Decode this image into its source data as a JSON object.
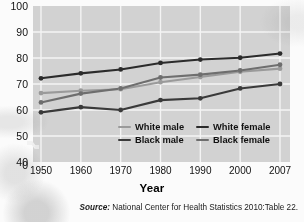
{
  "axis_title": "Year",
  "source": {
    "label": "Source:",
    "text": "National Center for Health Statistics 2010:Table 22."
  },
  "colors": {
    "plot_background": "#d2d2d2",
    "gridline": "#f4f4f4",
    "white_male": "#9a9a9a",
    "black_male": "#3a3a3a",
    "white_female": "#2b2b2b",
    "black_female": "#6e6e6e",
    "text": "#111111"
  },
  "legend": {
    "position": "inside-bottom-center",
    "entries": [
      {
        "label": "White male",
        "color": "#9a9a9a"
      },
      {
        "label": "White female",
        "color": "#2b2b2b"
      },
      {
        "label": "Black male",
        "color": "#3a3a3a"
      },
      {
        "label": "Black female",
        "color": "#6e6e6e"
      }
    ]
  },
  "chart_data": {
    "type": "line",
    "title": "",
    "subtitle": "",
    "xlabel": "Year",
    "ylabel": "",
    "categories": [
      "1950",
      "1960",
      "1970",
      "1980",
      "1990",
      "2000",
      "2007"
    ],
    "x": [
      1950,
      1960,
      1970,
      1980,
      1990,
      2000,
      2007
    ],
    "xtick_labels": [
      "1950",
      "1960",
      "1970",
      "1980",
      "1990",
      "2000",
      "2007"
    ],
    "ytick_labels": [
      "100",
      "90",
      "80",
      "70",
      "60",
      "50",
      "40",
      "0"
    ],
    "ytick_values": [
      100,
      90,
      80,
      70,
      60,
      50,
      40,
      0
    ],
    "ylim": [
      40,
      100
    ],
    "y_axis_broken": true,
    "y_axis_break_note": "axis breaks between 40 and 0",
    "grid": true,
    "grid_axis": "both",
    "legend_position": "inside-bottom-center",
    "series": [
      {
        "name": "White male",
        "color": "#9a9a9a",
        "values": [
          66.5,
          67.4,
          68.0,
          70.7,
          72.7,
          74.7,
          75.9
        ]
      },
      {
        "name": "Black male",
        "color": "#3a3a3a",
        "values": [
          59.1,
          61.1,
          60.0,
          63.8,
          64.5,
          68.3,
          70.0
        ]
      },
      {
        "name": "White female",
        "color": "#2b2b2b",
        "values": [
          72.2,
          74.1,
          75.6,
          78.1,
          79.4,
          80.1,
          81.7
        ]
      },
      {
        "name": "Black female",
        "color": "#6e6e6e",
        "values": [
          62.9,
          66.3,
          68.3,
          72.5,
          73.6,
          75.2,
          77.4
        ]
      }
    ]
  }
}
